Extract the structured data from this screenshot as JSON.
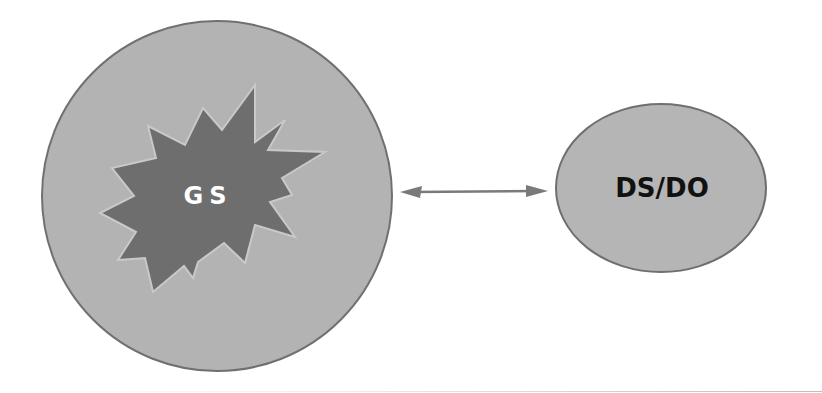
{
  "diagram": {
    "left_node": {
      "label": "GS",
      "shape": "circle with starburst",
      "fill": "#b3b3b3",
      "stroke": "#707070",
      "starburst_fill": "#6e6e6e",
      "label_color": "#ffffff"
    },
    "right_node": {
      "label": "DS/DO",
      "shape": "ellipse",
      "fill": "#b5b5b5",
      "stroke": "#6f6f6f",
      "label_color": "#111111"
    },
    "connector": {
      "type": "bidirectional-arrow",
      "color": "#7a7a7a",
      "from": "GS",
      "to": "DS/DO"
    }
  }
}
